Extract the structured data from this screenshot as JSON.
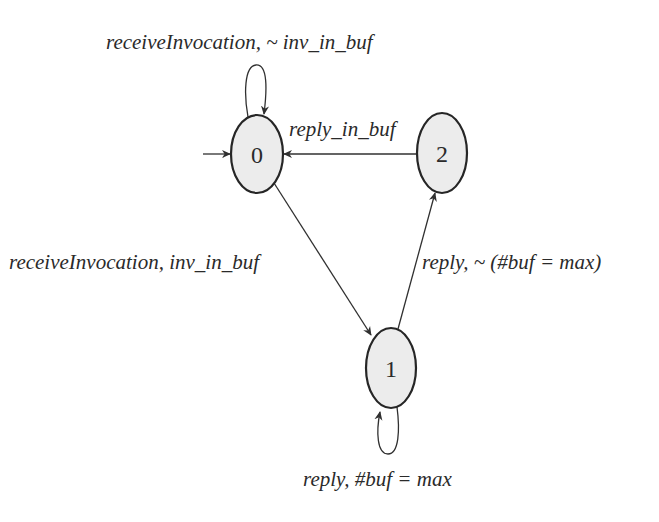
{
  "diagram": {
    "type": "state-machine",
    "initial_state": "0",
    "colors": {
      "background": "#ffffff",
      "state_fill": "#ececec",
      "state_stroke": "#262626",
      "edge": "#303030",
      "text": "#2a2a2a"
    },
    "states": [
      {
        "id": "0",
        "label": "0",
        "cx": 257,
        "cy": 154,
        "rx": 26,
        "ry": 39
      },
      {
        "id": "1",
        "label": "1",
        "cx": 391,
        "cy": 368,
        "rx": 25,
        "ry": 40
      },
      {
        "id": "2",
        "label": "2",
        "cx": 442,
        "cy": 153,
        "rx": 25,
        "ry": 40
      }
    ],
    "transitions": [
      {
        "from": "0",
        "to": "0",
        "label": "receiveInvocation, ~ inv_in_buf"
      },
      {
        "from": "2",
        "to": "0",
        "label": "reply_in_buf"
      },
      {
        "from": "0",
        "to": "1",
        "label": "receiveInvocation, inv_in_buf"
      },
      {
        "from": "1",
        "to": "2",
        "label": "reply, ~ (#buf = max)"
      },
      {
        "from": "1",
        "to": "1",
        "label": "reply, #buf = max"
      }
    ]
  }
}
